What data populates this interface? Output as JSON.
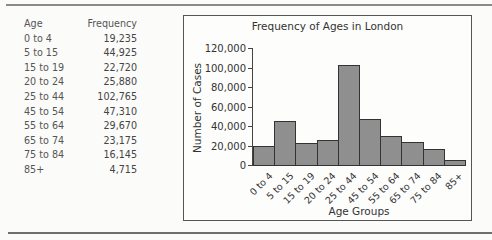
{
  "table": {
    "headers": [
      "Age",
      "Frequency"
    ],
    "rows": [
      [
        "0 to 4",
        "19,235"
      ],
      [
        "5 to 15",
        "44,925"
      ],
      [
        "15 to 19",
        "22,720"
      ],
      [
        "20 to 24",
        "25,880"
      ],
      [
        "25 to 44",
        "102,765"
      ],
      [
        "45 to 54",
        "47,310"
      ],
      [
        "55 to 64",
        "29,670"
      ],
      [
        "65 to 74",
        "23,175"
      ],
      [
        "75 to 84",
        "16,145"
      ],
      [
        "85+",
        "4,715"
      ]
    ]
  },
  "chart_data": {
    "type": "bar",
    "title": "Frequency of Ages in London",
    "xlabel": "Age Groups",
    "ylabel": "Number of Cases",
    "categories": [
      "0 to 4",
      "5 to 15",
      "15 to 19",
      "20 to 24",
      "25 to 44",
      "45 to 54",
      "55 to 64",
      "65 to 74",
      "75 to 84",
      "85+"
    ],
    "values": [
      19235,
      44925,
      22720,
      25880,
      102765,
      47310,
      29670,
      23175,
      16145,
      4715
    ],
    "ylim": [
      0,
      120000
    ],
    "yticks": [
      "0",
      "20,000",
      "40,000",
      "60,000",
      "80,000",
      "100,000",
      "120,000"
    ],
    "ytick_values": [
      0,
      20000,
      40000,
      60000,
      80000,
      100000,
      120000
    ],
    "grid": false,
    "legend": "none",
    "bar_color": "#8f8f8f"
  }
}
